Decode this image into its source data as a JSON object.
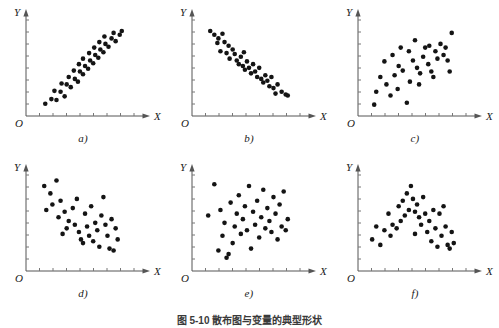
{
  "figure": {
    "caption": "图 5-10  散布图与变量的典型形状",
    "axis_x_label": "X",
    "axis_y_label": "Y",
    "origin_label": "O",
    "dot_color": "#141414",
    "axis_color": "#555555",
    "background": "#ffffff",
    "x_tick_count": 8,
    "y_tick_count": 8
  },
  "chart_data": [
    {
      "type": "scatter",
      "panel": "a)",
      "title": "",
      "xlabel": "X",
      "ylabel": "Y",
      "xlim": [
        0,
        100
      ],
      "ylim": [
        0,
        100
      ],
      "grid": false,
      "relationship": "strong positive linear",
      "points": [
        [
          13,
          9
        ],
        [
          19,
          14
        ],
        [
          24,
          13
        ],
        [
          22,
          23
        ],
        [
          28,
          22
        ],
        [
          32,
          17
        ],
        [
          29,
          31
        ],
        [
          34,
          30
        ],
        [
          38,
          27
        ],
        [
          36,
          38
        ],
        [
          42,
          36
        ],
        [
          45,
          33
        ],
        [
          41,
          45
        ],
        [
          47,
          44
        ],
        [
          50,
          41
        ],
        [
          46,
          52
        ],
        [
          52,
          50
        ],
        [
          55,
          47
        ],
        [
          50,
          58
        ],
        [
          57,
          56
        ],
        [
          60,
          53
        ],
        [
          56,
          64
        ],
        [
          62,
          62
        ],
        [
          65,
          59
        ],
        [
          61,
          70
        ],
        [
          67,
          68
        ],
        [
          70,
          65
        ],
        [
          66,
          76
        ],
        [
          72,
          74
        ],
        [
          75,
          71
        ],
        [
          71,
          82
        ],
        [
          78,
          80
        ],
        [
          82,
          77
        ],
        [
          80,
          86
        ],
        [
          86,
          84
        ],
        [
          88,
          88
        ]
      ]
    },
    {
      "type": "scatter",
      "panel": "b)",
      "title": "",
      "xlabel": "X",
      "ylabel": "Y",
      "xlim": [
        0,
        100
      ],
      "ylim": [
        0,
        100
      ],
      "grid": false,
      "relationship": "strong negative linear",
      "points": [
        [
          12,
          88
        ],
        [
          16,
          84
        ],
        [
          20,
          80
        ],
        [
          24,
          85
        ],
        [
          19,
          75
        ],
        [
          26,
          76
        ],
        [
          30,
          72
        ],
        [
          22,
          66
        ],
        [
          28,
          64
        ],
        [
          34,
          68
        ],
        [
          36,
          63
        ],
        [
          31,
          58
        ],
        [
          38,
          56
        ],
        [
          42,
          60
        ],
        [
          45,
          65
        ],
        [
          40,
          52
        ],
        [
          44,
          50
        ],
        [
          48,
          55
        ],
        [
          46,
          46
        ],
        [
          50,
          48
        ],
        [
          54,
          52
        ],
        [
          52,
          42
        ],
        [
          56,
          44
        ],
        [
          60,
          48
        ],
        [
          58,
          38
        ],
        [
          62,
          36
        ],
        [
          66,
          40
        ],
        [
          64,
          32
        ],
        [
          68,
          34
        ],
        [
          72,
          38
        ],
        [
          70,
          28
        ],
        [
          74,
          26
        ],
        [
          78,
          30
        ],
        [
          76,
          20
        ],
        [
          82,
          22
        ],
        [
          86,
          19
        ],
        [
          88,
          18
        ]
      ]
    },
    {
      "type": "scatter",
      "panel": "c)",
      "title": "",
      "xlabel": "X",
      "ylabel": "Y",
      "xlim": [
        0,
        100
      ],
      "ylim": [
        0,
        100
      ],
      "grid": false,
      "relationship": "weak positive scatter",
      "points": [
        [
          10,
          8
        ],
        [
          12,
          22
        ],
        [
          16,
          38
        ],
        [
          20,
          55
        ],
        [
          22,
          30
        ],
        [
          26,
          18
        ],
        [
          30,
          40
        ],
        [
          28,
          62
        ],
        [
          33,
          25
        ],
        [
          36,
          70
        ],
        [
          38,
          45
        ],
        [
          34,
          50
        ],
        [
          42,
          10
        ],
        [
          45,
          33
        ],
        [
          48,
          56
        ],
        [
          44,
          66
        ],
        [
          50,
          78
        ],
        [
          52,
          48
        ],
        [
          55,
          42
        ],
        [
          58,
          60
        ],
        [
          54,
          30
        ],
        [
          60,
          70
        ],
        [
          63,
          52
        ],
        [
          66,
          44
        ],
        [
          64,
          72
        ],
        [
          70,
          66
        ],
        [
          72,
          58
        ],
        [
          68,
          38
        ],
        [
          75,
          74
        ],
        [
          78,
          62
        ],
        [
          80,
          70
        ],
        [
          84,
          44
        ],
        [
          86,
          86
        ],
        [
          82,
          56
        ]
      ]
    },
    {
      "type": "scatter",
      "panel": "d)",
      "title": "",
      "xlabel": "X",
      "ylabel": "Y",
      "xlim": [
        0,
        100
      ],
      "ylim": [
        0,
        100
      ],
      "grid": false,
      "relationship": "weak negative scatter",
      "points": [
        [
          12,
          88
        ],
        [
          18,
          80
        ],
        [
          24,
          94
        ],
        [
          20,
          68
        ],
        [
          14,
          62
        ],
        [
          28,
          72
        ],
        [
          26,
          54
        ],
        [
          32,
          60
        ],
        [
          36,
          50
        ],
        [
          34,
          42
        ],
        [
          30,
          36
        ],
        [
          40,
          64
        ],
        [
          44,
          74
        ],
        [
          42,
          46
        ],
        [
          46,
          38
        ],
        [
          48,
          30
        ],
        [
          52,
          58
        ],
        [
          54,
          44
        ],
        [
          50,
          26
        ],
        [
          58,
          66
        ],
        [
          56,
          34
        ],
        [
          62,
          48
        ],
        [
          60,
          28
        ],
        [
          64,
          40
        ],
        [
          66,
          22
        ],
        [
          70,
          76
        ],
        [
          68,
          56
        ],
        [
          72,
          46
        ],
        [
          74,
          34
        ],
        [
          78,
          52
        ],
        [
          76,
          20
        ],
        [
          80,
          18
        ],
        [
          84,
          30
        ],
        [
          82,
          42
        ]
      ]
    },
    {
      "type": "scatter",
      "panel": "e)",
      "title": "",
      "xlabel": "X",
      "ylabel": "Y",
      "xlim": [
        0,
        100
      ],
      "ylim": [
        0,
        100
      ],
      "grid": false,
      "relationship": "no correlation / random",
      "points": [
        [
          10,
          56
        ],
        [
          16,
          90
        ],
        [
          20,
          18
        ],
        [
          24,
          34
        ],
        [
          22,
          62
        ],
        [
          26,
          48
        ],
        [
          28,
          10
        ],
        [
          30,
          14
        ],
        [
          32,
          70
        ],
        [
          34,
          26
        ],
        [
          36,
          44
        ],
        [
          38,
          58
        ],
        [
          40,
          78
        ],
        [
          42,
          36
        ],
        [
          44,
          52
        ],
        [
          46,
          66
        ],
        [
          48,
          40
        ],
        [
          50,
          88
        ],
        [
          52,
          20
        ],
        [
          54,
          60
        ],
        [
          56,
          46
        ],
        [
          58,
          72
        ],
        [
          60,
          32
        ],
        [
          62,
          54
        ],
        [
          64,
          84
        ],
        [
          66,
          42
        ],
        [
          68,
          64
        ],
        [
          70,
          50
        ],
        [
          72,
          38
        ],
        [
          74,
          76
        ],
        [
          76,
          58
        ],
        [
          78,
          30
        ],
        [
          80,
          68
        ],
        [
          82,
          44
        ],
        [
          84,
          82
        ],
        [
          86,
          40
        ],
        [
          88,
          52
        ]
      ]
    },
    {
      "type": "scatter",
      "panel": "f)",
      "title": "",
      "xlabel": "X",
      "ylabel": "Y",
      "xlim": [
        0,
        100
      ],
      "ylim": [
        0,
        100
      ],
      "grid": false,
      "relationship": "curvilinear inverted-U",
      "points": [
        [
          8,
          30
        ],
        [
          12,
          44
        ],
        [
          16,
          24
        ],
        [
          20,
          40
        ],
        [
          24,
          58
        ],
        [
          28,
          46
        ],
        [
          26,
          34
        ],
        [
          32,
          42
        ],
        [
          34,
          66
        ],
        [
          36,
          50
        ],
        [
          40,
          56
        ],
        [
          38,
          72
        ],
        [
          44,
          62
        ],
        [
          42,
          80
        ],
        [
          46,
          88
        ],
        [
          48,
          74
        ],
        [
          50,
          60
        ],
        [
          52,
          68
        ],
        [
          54,
          54
        ],
        [
          56,
          46
        ],
        [
          58,
          76
        ],
        [
          60,
          58
        ],
        [
          62,
          38
        ],
        [
          64,
          50
        ],
        [
          66,
          28
        ],
        [
          68,
          62
        ],
        [
          70,
          42
        ],
        [
          72,
          22
        ],
        [
          74,
          58
        ],
        [
          76,
          34
        ],
        [
          78,
          66
        ],
        [
          80,
          44
        ],
        [
          82,
          24
        ],
        [
          84,
          20
        ],
        [
          86,
          38
        ],
        [
          88,
          26
        ],
        [
          50,
          36
        ]
      ]
    }
  ]
}
